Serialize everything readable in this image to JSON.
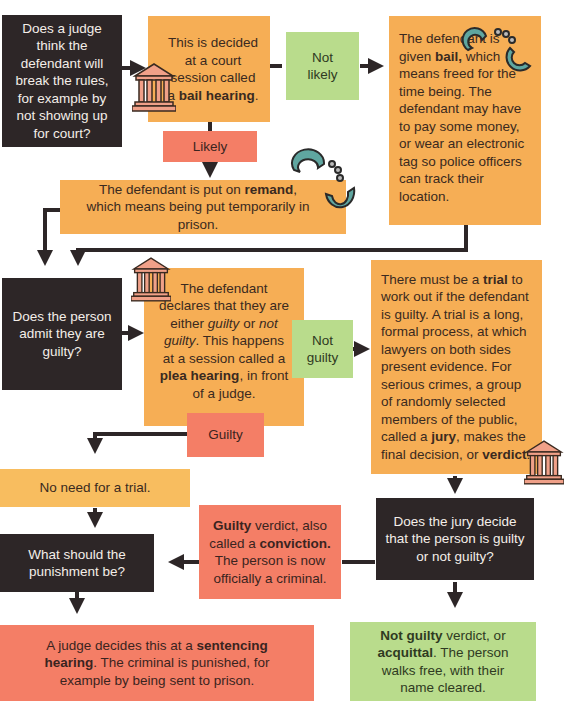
{
  "boxes": {
    "q_bail": "Does a judge think the defendant will break the rules, for example by not showing up for court?",
    "bail_hearing": {
      "pre": "This is decided at a court session called a ",
      "bold": "bail hearing",
      "post": "."
    },
    "not_likely": "Not likely",
    "bail_given": {
      "pre": "The defendant is given ",
      "bold": "bail,",
      "post": " which means freed for the time being. The defendant may have to pay some money, or wear an electronic tag so police officers can track their location."
    },
    "likely": "Likely",
    "remand": {
      "pre": "The defendant is put on ",
      "bold": "remand",
      "post": ", which means being put temporarily in prison."
    },
    "q_admit": "Does the person admit they are guilty?",
    "plea": {
      "p1": "The defendant declares that they are either ",
      "i1": "guilty",
      "p2": " or ",
      "i2": "not guilty",
      "p3": ". This happens at a session called a ",
      "bold": "plea hearing",
      "p4": ", in front of a judge."
    },
    "not_guilty": "Not guilty",
    "trial": {
      "p1": "There must be a ",
      "b1": "trial",
      "p2": " to work out if the defendant is guilty. A trial is a long, formal process, at which lawyers on both sides present evidence. For serious crimes, a group of randomly selected members of the public, called a ",
      "b2": "jury",
      "p3": ", makes the final decision, or ",
      "b3": "verdict",
      "p4": "."
    },
    "guilty": "Guilty",
    "no_trial": "No need for a trial.",
    "q_jury": "Does the jury decide that the person is guilty or not guilty?",
    "conviction": {
      "b1": "Guilty",
      "p1": " verdict, also called a ",
      "b2": "conviction.",
      "p2": " The person is now officially a criminal."
    },
    "q_punish": "What should the punishment be?",
    "sentencing": {
      "p1": "A judge decides this at a ",
      "b1": "sentencing hearing",
      "p2": ". The criminal is punished, for example by being sent to prison."
    },
    "acquittal": {
      "b1": "Not guilty",
      "p1": " verdict, or ",
      "b2": "acquittal",
      "p2": ". The person walks free, with their name cleared."
    }
  },
  "icons": [
    "courthouse-icon",
    "handcuffs-icon"
  ],
  "colors": {
    "dark": "#2d2627",
    "orange": "#f6ae55",
    "red": "#f47e66",
    "green": "#b9dc8c",
    "teal": "#5fa6a0",
    "courthouse": "#f0a088"
  }
}
